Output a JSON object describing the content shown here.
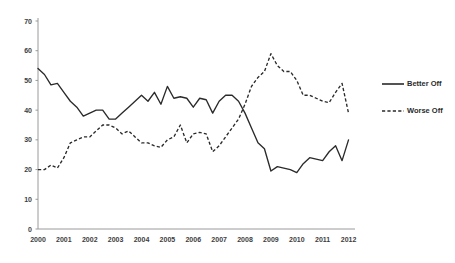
{
  "chart_data": {
    "type": "line",
    "title": "",
    "xlabel": "",
    "ylabel": "",
    "ylim": [
      0,
      70
    ],
    "ytick_step": 10,
    "yticks": [
      0,
      10,
      20,
      30,
      40,
      50,
      60,
      70
    ],
    "categories": [
      "2000",
      "2001",
      "2002",
      "2003",
      "2004",
      "2005",
      "2006",
      "2007",
      "2008",
      "2009",
      "2010",
      "2011",
      "2012"
    ],
    "xlim": [
      2000,
      2012.25
    ],
    "grid": false,
    "legend_position": "right",
    "series": [
      {
        "name": "Better Off",
        "style": "solid",
        "color": "#2a2a2a",
        "x": [
          2000.0,
          2000.25,
          2000.5,
          2000.75,
          2001.0,
          2001.25,
          2001.5,
          2001.75,
          2002.0,
          2002.25,
          2002.5,
          2002.75,
          2003.0,
          2003.25,
          2003.5,
          2003.75,
          2004.0,
          2004.25,
          2004.5,
          2004.75,
          2005.0,
          2005.25,
          2005.5,
          2005.75,
          2006.0,
          2006.25,
          2006.5,
          2006.75,
          2007.0,
          2007.25,
          2007.5,
          2007.75,
          2008.0,
          2008.25,
          2008.5,
          2008.75,
          2009.0,
          2009.25,
          2009.5,
          2009.75,
          2010.0,
          2010.25,
          2010.5,
          2010.75,
          2011.0,
          2011.25,
          2011.5,
          2011.75,
          2012.0
        ],
        "values": [
          54.0,
          52.0,
          48.5,
          49.0,
          46.0,
          43.0,
          41.0,
          38.0,
          39.0,
          40.0,
          40.0,
          37.0,
          37.0,
          39.0,
          41.0,
          43.0,
          45.0,
          43.0,
          46.0,
          42.0,
          48.0,
          44.0,
          44.5,
          44.0,
          41.0,
          44.0,
          43.5,
          39.0,
          43.0,
          45.0,
          45.0,
          43.0,
          39.0,
          34.0,
          29.0,
          27.0,
          19.5,
          21.0,
          20.5,
          20.0,
          19.0,
          22.0,
          24.0,
          23.5,
          23.0,
          26.0,
          28.0,
          23.0,
          30.0
        ]
      },
      {
        "name": "Worse Off",
        "style": "dashed",
        "color": "#2a2a2a",
        "x": [
          2000.0,
          2000.25,
          2000.5,
          2000.75,
          2001.0,
          2001.25,
          2001.5,
          2001.75,
          2002.0,
          2002.25,
          2002.5,
          2002.75,
          2003.0,
          2003.25,
          2003.5,
          2003.75,
          2004.0,
          2004.25,
          2004.5,
          2004.75,
          2005.0,
          2005.25,
          2005.5,
          2005.75,
          2006.0,
          2006.25,
          2006.5,
          2006.75,
          2007.0,
          2007.25,
          2007.5,
          2007.75,
          2008.0,
          2008.25,
          2008.5,
          2008.75,
          2009.0,
          2009.25,
          2009.5,
          2009.75,
          2010.0,
          2010.25,
          2010.5,
          2010.75,
          2011.0,
          2011.25,
          2011.5,
          2011.75,
          2012.0
        ],
        "values": [
          20.0,
          20.0,
          21.5,
          20.5,
          24.0,
          29.0,
          30.0,
          31.0,
          31.0,
          33.0,
          35.0,
          35.0,
          34.0,
          32.0,
          33.0,
          31.0,
          29.0,
          29.0,
          28.0,
          27.5,
          30.0,
          31.0,
          35.0,
          29.0,
          32.0,
          32.5,
          32.0,
          26.0,
          28.0,
          31.0,
          34.0,
          37.0,
          42.0,
          48.0,
          51.0,
          53.0,
          59.0,
          55.0,
          53.0,
          53.0,
          50.0,
          45.0,
          45.0,
          44.0,
          43.0,
          42.5,
          46.0,
          49.0,
          39.0
        ]
      }
    ]
  },
  "legend": {
    "items": [
      {
        "label": "Better Off",
        "style": "solid"
      },
      {
        "label": "Worse Off",
        "style": "dashed"
      }
    ]
  },
  "axes": {
    "y_axis_name": "value-axis",
    "x_axis_name": "year-axis"
  }
}
